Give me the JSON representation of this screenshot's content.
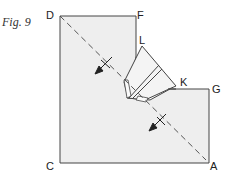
{
  "figure": {
    "caption": "Fig. 9",
    "points": {
      "D": "D",
      "F": "F",
      "L": "L",
      "K": "K",
      "G": "G",
      "A": "A",
      "C": "C"
    },
    "colors": {
      "paper": "#eeeeee",
      "stroke": "#444444",
      "flap": "#f2f2f2"
    },
    "annotations": [
      "dashed fold line D–A",
      "two fold-direction arrows"
    ]
  }
}
